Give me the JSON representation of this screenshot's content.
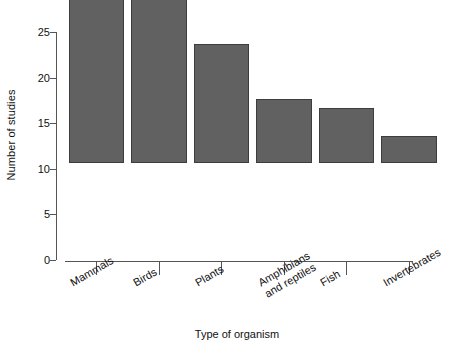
{
  "chart_data": {
    "type": "bar",
    "title": "",
    "subtitle": "",
    "xlabel": "Type of organism",
    "ylabel": "Number of studies",
    "categories": [
      "Mammals",
      "Birds",
      "Plants",
      "Amphibians\nand reptiles",
      "Fish",
      "Invertebrates"
    ],
    "values": [
      27,
      24,
      13,
      7,
      6,
      3
    ],
    "ylim": [
      0,
      27.8
    ],
    "yticks": [
      0,
      5,
      10,
      15,
      20,
      25
    ],
    "ytick_labels": [
      "0",
      "5",
      "10",
      "15",
      "20",
      "25"
    ],
    "grid": false,
    "legend": null,
    "bar_color": "#616161",
    "bar_edge_color": "#3d3d3d",
    "axis_color": "#555555",
    "background_color": "#ffffff",
    "category_label_rotation_deg": -30
  }
}
